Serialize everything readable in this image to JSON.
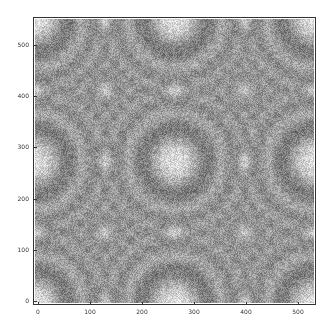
{
  "chart_data": {
    "type": "heatmap",
    "title": "",
    "xlabel": "",
    "ylabel": "",
    "xlim": [
      0,
      540
    ],
    "ylim": [
      0,
      540
    ],
    "x_ticks": [
      "0",
      "100",
      "200",
      "300",
      "400",
      "500"
    ],
    "y_ticks": [
      "0",
      "100",
      "200",
      "300",
      "400",
      "500"
    ],
    "grid": false,
    "colormap": "grayscale",
    "ring_centers": [
      {
        "x": 0,
        "y": 0,
        "size": "large"
      },
      {
        "x": 270,
        "y": 0,
        "size": "large"
      },
      {
        "x": 540,
        "y": 0,
        "size": "large"
      },
      {
        "x": 0,
        "y": 270,
        "size": "large"
      },
      {
        "x": 270,
        "y": 270,
        "size": "large"
      },
      {
        "x": 540,
        "y": 270,
        "size": "large"
      },
      {
        "x": 0,
        "y": 540,
        "size": "large"
      },
      {
        "x": 270,
        "y": 540,
        "size": "large"
      },
      {
        "x": 540,
        "y": 540,
        "size": "large"
      },
      {
        "x": 135,
        "y": 135,
        "size": "small"
      },
      {
        "x": 405,
        "y": 135,
        "size": "small"
      },
      {
        "x": 135,
        "y": 405,
        "size": "small"
      },
      {
        "x": 405,
        "y": 405,
        "size": "small"
      },
      {
        "x": 135,
        "y": 270,
        "size": "small"
      },
      {
        "x": 405,
        "y": 270,
        "size": "small"
      },
      {
        "x": 270,
        "y": 135,
        "size": "small"
      },
      {
        "x": 270,
        "y": 405,
        "size": "small"
      },
      {
        "x": 135,
        "y": 0,
        "size": "small"
      },
      {
        "x": 405,
        "y": 0,
        "size": "small"
      },
      {
        "x": 135,
        "y": 540,
        "size": "small"
      },
      {
        "x": 405,
        "y": 540,
        "size": "small"
      },
      {
        "x": 0,
        "y": 135,
        "size": "small"
      },
      {
        "x": 0,
        "y": 405,
        "size": "small"
      },
      {
        "x": 540,
        "y": 135,
        "size": "small"
      },
      {
        "x": 540,
        "y": 405,
        "size": "small"
      }
    ]
  }
}
